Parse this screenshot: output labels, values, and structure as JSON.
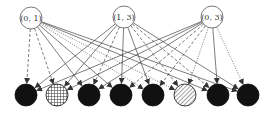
{
  "diagram": {
    "type": "bipartite-directed-graph",
    "colors": {
      "edge": "#444444",
      "top_node_stroke": "#555555",
      "top_node_fill": "#ffffff",
      "bottom_node_fill": "#111111",
      "hatch": "#333333"
    },
    "top_nodes": [
      {
        "id": "t0",
        "label": "(0, 1)",
        "x": 31,
        "y": 18,
        "r": 11
      },
      {
        "id": "t1",
        "label": "(1, 3)",
        "x": 124,
        "y": 17,
        "r": 11
      },
      {
        "id": "t2",
        "label": "(0, 3)",
        "x": 212,
        "y": 17,
        "r": 11
      }
    ],
    "bottom_nodes": [
      {
        "id": "b0",
        "x": 26,
        "y": 95,
        "r": 11,
        "fill": "solid"
      },
      {
        "id": "b1",
        "x": 57,
        "y": 95,
        "r": 11,
        "fill": "grid"
      },
      {
        "id": "b2",
        "x": 89,
        "y": 95,
        "r": 11,
        "fill": "solid"
      },
      {
        "id": "b3",
        "x": 121,
        "y": 95,
        "r": 11,
        "fill": "solid"
      },
      {
        "id": "b4",
        "x": 153,
        "y": 95,
        "r": 11,
        "fill": "solid"
      },
      {
        "id": "b5",
        "x": 185,
        "y": 95,
        "r": 11,
        "fill": "diagonal"
      },
      {
        "id": "b6",
        "x": 218,
        "y": 95,
        "r": 11,
        "fill": "solid"
      },
      {
        "id": "b7",
        "x": 248,
        "y": 95,
        "r": 11,
        "fill": "solid"
      }
    ],
    "edges": [
      {
        "from": 0,
        "to": 0,
        "style": "dashed"
      },
      {
        "from": 0,
        "to": 1,
        "style": "dashed"
      },
      {
        "from": 0,
        "to": 2,
        "style": "solid"
      },
      {
        "from": 0,
        "to": 3,
        "style": "solid"
      },
      {
        "from": 0,
        "to": 4,
        "style": "dotted"
      },
      {
        "from": 0,
        "to": 5,
        "style": "dotted"
      },
      {
        "from": 0,
        "to": 6,
        "style": "solid"
      },
      {
        "from": 0,
        "to": 7,
        "style": "solid"
      },
      {
        "from": 1,
        "to": 0,
        "style": "solid"
      },
      {
        "from": 1,
        "to": 1,
        "style": "solid"
      },
      {
        "from": 1,
        "to": 2,
        "style": "dashed"
      },
      {
        "from": 1,
        "to": 3,
        "style": "solid"
      },
      {
        "from": 1,
        "to": 4,
        "style": "solid"
      },
      {
        "from": 1,
        "to": 5,
        "style": "dashed"
      },
      {
        "from": 1,
        "to": 6,
        "style": "dashed"
      },
      {
        "from": 1,
        "to": 7,
        "style": "solid"
      },
      {
        "from": 2,
        "to": 0,
        "style": "solid"
      },
      {
        "from": 2,
        "to": 1,
        "style": "solid"
      },
      {
        "from": 2,
        "to": 2,
        "style": "solid"
      },
      {
        "from": 2,
        "to": 3,
        "style": "dashed"
      },
      {
        "from": 2,
        "to": 4,
        "style": "dashed"
      },
      {
        "from": 2,
        "to": 5,
        "style": "dotted"
      },
      {
        "from": 2,
        "to": 6,
        "style": "solid"
      },
      {
        "from": 2,
        "to": 7,
        "style": "dotted"
      }
    ]
  }
}
